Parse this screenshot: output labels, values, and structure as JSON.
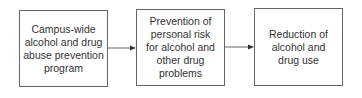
{
  "diagram": {
    "type": "flowchart",
    "direction": "left-to-right",
    "nodes": [
      {
        "id": "n1",
        "label": "Campus-wide\nalcohol and drug\nabuse prevention\nprogram"
      },
      {
        "id": "n2",
        "label": "Prevention of\npersonal risk\nfor alcohol and\nother drug\nproblems"
      },
      {
        "id": "n3",
        "label": "Reduction of\nalcohol and\ndrug use"
      }
    ],
    "edges": [
      {
        "from": "n1",
        "to": "n2"
      },
      {
        "from": "n2",
        "to": "n3"
      }
    ],
    "colors": {
      "border": "#666666",
      "text": "#333333",
      "background": "#ffffff"
    }
  }
}
